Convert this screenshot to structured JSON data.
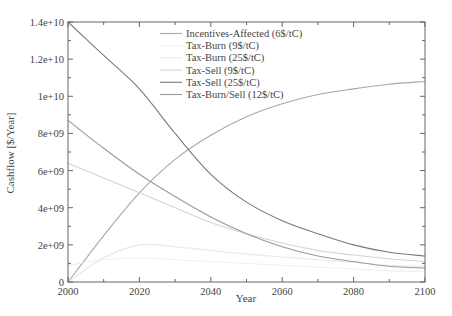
{
  "chart_data": {
    "type": "line",
    "title": "",
    "xlabel": "Year",
    "ylabel": "Cashflow [$/Year]",
    "xlim": [
      2000,
      2100
    ],
    "ylim": [
      0,
      14000000000.0
    ],
    "grid": false,
    "legend_position": "upper-center (inside plot)",
    "x_ticks": [
      2000,
      2020,
      2040,
      2060,
      2080,
      2100
    ],
    "x_tick_labels": [
      "2000",
      "2020",
      "2040",
      "2060",
      "2080",
      "2100"
    ],
    "y_ticks": [
      0,
      2000000000.0,
      4000000000.0,
      6000000000.0,
      8000000000.0,
      10000000000.0,
      12000000000.0,
      14000000000.0
    ],
    "y_tick_labels": [
      "0",
      "2e+09",
      "4e+09",
      "6e+09",
      "8e+09",
      "1e+10",
      "1.2e+10",
      "1.4e+10"
    ],
    "x": [
      2000,
      2010,
      2020,
      2030,
      2040,
      2050,
      2060,
      2070,
      2080,
      2090,
      2100
    ],
    "series": [
      {
        "name": "Incentives-Affected (6$/tC)",
        "color": "#a8a8a8",
        "values": [
          0,
          2500000000.0,
          4800000000.0,
          6600000000.0,
          7900000000.0,
          8900000000.0,
          9600000000.0,
          10100000000.0,
          10400000000.0,
          10650000000.0,
          10800000000.0
        ]
      },
      {
        "name": "Tax-Burn (9$/tC)",
        "color": "#f0f0f0",
        "values": [
          900000000.0,
          1200000000.0,
          1300000000.0,
          1200000000.0,
          1100000000.0,
          1000000000.0,
          900000000.0,
          800000000.0,
          700000000.0,
          600000000.0,
          550000000.0
        ]
      },
      {
        "name": "Tax-Burn (25$/tC)",
        "color": "#e8e8e8",
        "values": [
          0,
          1300000000.0,
          2000000000.0,
          1900000000.0,
          1700000000.0,
          1500000000.0,
          1350000000.0,
          1200000000.0,
          1050000000.0,
          900000000.0,
          850000000.0
        ]
      },
      {
        "name": "Tax-Sell (9$/tC)",
        "color": "#d4d4d4",
        "values": [
          6400000000.0,
          5600000000.0,
          4800000000.0,
          4000000000.0,
          3200000000.0,
          2600000000.0,
          2100000000.0,
          1700000000.0,
          1450000000.0,
          1250000000.0,
          1100000000.0
        ]
      },
      {
        "name": "Tax-Sell (25$/tC)",
        "color": "#7a7a7a",
        "values": [
          14000000000.0,
          12200000000.0,
          10400000000.0,
          8000000000.0,
          5800000000.0,
          4300000000.0,
          3300000000.0,
          2600000000.0,
          2000000000.0,
          1600000000.0,
          1400000000.0
        ]
      },
      {
        "name": "Tax-Burn/Sell (12$/tC)",
        "color": "#9a9a9a",
        "values": [
          8700000000.0,
          7200000000.0,
          5800000000.0,
          4600000000.0,
          3500000000.0,
          2600000000.0,
          1900000000.0,
          1400000000.0,
          1100000000.0,
          850000000.0,
          750000000.0
        ]
      }
    ]
  },
  "legend": {
    "items": [
      {
        "label": "Incentives-Affected (6$/tC)",
        "swatch": true
      },
      {
        "label": "Tax-Burn (9$/tC)",
        "swatch": false
      },
      {
        "label": "Tax-Burn (25$/tC)",
        "swatch": false
      },
      {
        "label": "Tax-Sell (9$/tC)",
        "swatch": true
      },
      {
        "label": "Tax-Sell (25$/tC)",
        "swatch": true
      },
      {
        "label": "Tax-Burn/Sell (12$/tC)",
        "swatch": false
      }
    ]
  }
}
